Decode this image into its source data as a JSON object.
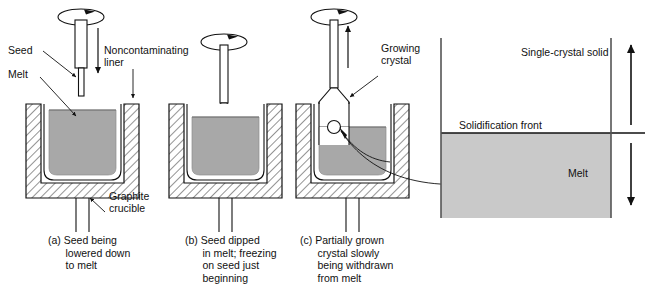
{
  "figure": {
    "title_present": false,
    "background": "#ffffff",
    "colors": {
      "melt_gray": "#a8a8a8",
      "detail_melt_gray": "#c9c9c9",
      "line": "#1a1a1a",
      "hatch": "#3a3a3a",
      "liner_white": "#ffffff"
    }
  },
  "labels": {
    "seed": "Seed",
    "melt": "Melt",
    "noncontaminating_liner": "Noncontaminating\nliner",
    "graphite_crucible": "Graphite\ncrucible",
    "growing_crystal": "Growing\ncrystal"
  },
  "captions": [
    {
      "tag": "(a)",
      "text": "(a) Seed being\n      lowered down\n      to melt"
    },
    {
      "tag": "(b)",
      "text": "(b) Seed dipped\n      in melt; freezing\n      on seed just\n      beginning"
    },
    {
      "tag": "(c)",
      "text": "(c) Partially grown\n      crystal slowly\n      being withdrawn\n      from melt"
    }
  ],
  "detail_panel": {
    "single_crystal_solid": "Single-crystal solid",
    "solidification_front": "Solidification front",
    "melt": "Melt",
    "arrow_up_meaning": "crystal pulled upward",
    "arrow_down_meaning": "melt consumed downward"
  },
  "icons": {
    "rotation_a": "rotation-arrow-icon",
    "rotation_b": "rotation-arrow-icon",
    "rotation_c": "rotation-arrow-icon",
    "pull_down_a": "down-arrow-icon",
    "pull_up_c": "up-arrow-icon",
    "detail_link": "curved-callout-arrow-icon"
  }
}
